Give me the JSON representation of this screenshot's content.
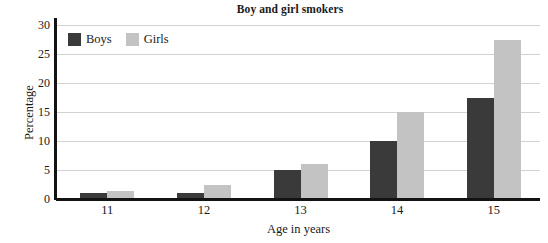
{
  "chart_data": {
    "type": "bar",
    "title": "Boy and girl smokers",
    "xlabel": "Age in years",
    "ylabel": "Percentage",
    "categories": [
      "11",
      "12",
      "13",
      "14",
      "15"
    ],
    "series": [
      {
        "name": "Boys",
        "color": "#3a3a3a",
        "values": [
          1,
          1,
          5,
          10,
          17.5
        ]
      },
      {
        "name": "Girls",
        "color": "#c3c3c3",
        "values": [
          1.4,
          2.5,
          6,
          15,
          27.5
        ]
      }
    ],
    "ylim": [
      0,
      30
    ],
    "yticks": [
      0,
      5,
      10,
      15,
      20,
      25,
      30
    ],
    "ytick_labels": [
      "0",
      "5",
      "10",
      "15",
      "20",
      "25",
      "30"
    ],
    "grid": true,
    "legend_position": "top-left"
  }
}
